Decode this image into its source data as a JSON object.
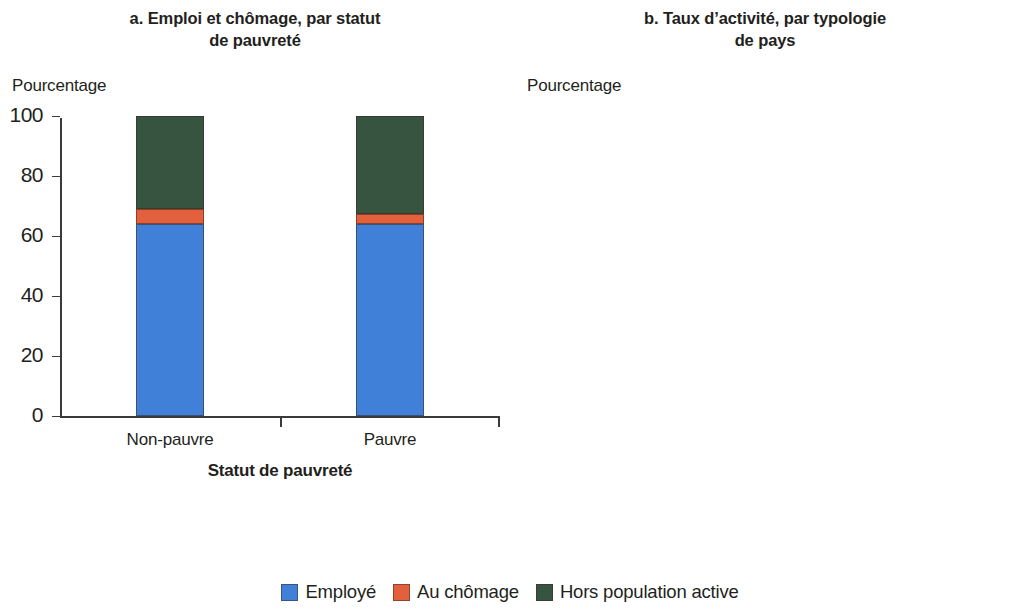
{
  "figure": {
    "legend": {
      "items": [
        {
          "label": "Employé",
          "key": "employed",
          "color": "#4180d8"
        },
        {
          "label": "Au chômage",
          "key": "unemployed",
          "color": "#e2603c"
        },
        {
          "label": "Hors population active",
          "key": "inactive",
          "color": "#36543f"
        }
      ]
    }
  },
  "chart_data": [
    {
      "id": "panel-a",
      "type": "bar",
      "stacked": true,
      "title": "a. Emploi et chômage, par statut\nde pauvreté",
      "ylabel": "Pourcentage",
      "xlabel": "Statut de pauvreté",
      "ylim": [
        0,
        100
      ],
      "yticks": [
        0,
        20,
        40,
        60,
        80,
        100
      ],
      "ytick_labels": [
        "0",
        "20",
        "40",
        "60",
        "80",
        "100"
      ],
      "grid": false,
      "categories": [
        "Non-pauvre",
        "Pauvre"
      ],
      "series": [
        {
          "name": "Employé",
          "color": "#4180d8",
          "values": [
            64,
            64
          ]
        },
        {
          "name": "Au chômage",
          "color": "#e2603c",
          "values": [
            5,
            3.5
          ]
        },
        {
          "name": "Hors population active",
          "color": "#36543f",
          "values": [
            31,
            32.5
          ]
        }
      ],
      "value_labels": []
    },
    {
      "id": "panel-b",
      "type": "bar",
      "stacked": true,
      "title": "b. Taux d’activité, par typologie\nde pays",
      "ylabel": "Pourcentage",
      "xlabel": "Typologie",
      "ylim": [
        0,
        100
      ],
      "yticks": [
        0,
        20,
        40,
        60,
        80,
        100
      ],
      "ytick_labels": [
        "0",
        "20",
        "40",
        "60",
        "80",
        "100"
      ],
      "grid": false,
      "categories": [
        "RR et jamais\nFCS",
        "Pas RR et\nFCS",
        "Pas RR et\njamais FCS",
        "Tous les\npays",
        "RR et\nFCS"
      ],
      "series": [
        {
          "name": "Employé",
          "color": "#4180d8",
          "values": [
            48.5,
            63,
            64.5,
            64,
            69.5
          ]
        },
        {
          "name": "Au chômage",
          "color": "#e2603c",
          "values": [
            13.5,
            3,
            3.5,
            5,
            3.5
          ]
        }
      ],
      "value_labels": [
        "62",
        "66",
        "68",
        "69",
        "73"
      ]
    }
  ]
}
